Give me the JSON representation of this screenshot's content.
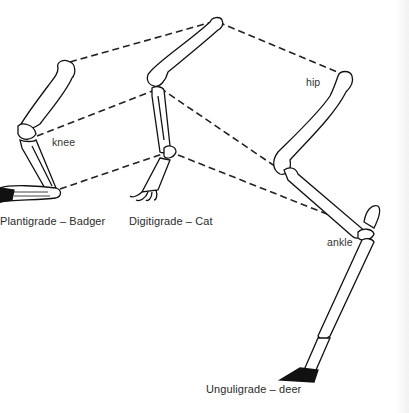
{
  "diagram": {
    "colors": {
      "line": "#111111",
      "dash": "#222222",
      "text": "#333333",
      "background": "#ffffff"
    },
    "labels": {
      "knee": "knee",
      "hip": "hip",
      "ankle": "ankle"
    },
    "captions": {
      "badger": "Plantigrade – Badger",
      "cat": "Digitigrade – Cat",
      "deer": "Unguligrade – deer"
    },
    "legs": [
      {
        "id": "badger",
        "type": "Plantigrade",
        "animal": "Badger"
      },
      {
        "id": "cat",
        "type": "Digitigrade",
        "animal": "Cat"
      },
      {
        "id": "deer",
        "type": "Unguligrade",
        "animal": "deer"
      }
    ],
    "connectors": [
      {
        "from": "badger-hip",
        "to": "cat-hip"
      },
      {
        "from": "cat-hip",
        "to": "deer-hip"
      },
      {
        "from": "badger-knee",
        "to": "cat-knee"
      },
      {
        "from": "cat-knee",
        "to": "deer-knee"
      },
      {
        "from": "badger-ankle",
        "to": "cat-ankle"
      },
      {
        "from": "cat-ankle",
        "to": "deer-ankle"
      }
    ]
  }
}
